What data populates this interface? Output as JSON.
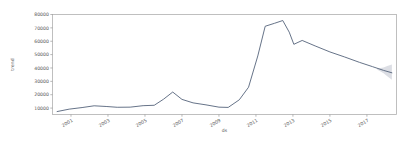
{
  "figure": {
    "background_color": "#ffffff",
    "line_color": "#4a5a72",
    "band_color": "#8a93a5",
    "spine_color": "#b0b0b0"
  },
  "chart_data": {
    "type": "line",
    "title": "",
    "xlabel": "ds",
    "ylabel": "trend",
    "grid": false,
    "legend": null,
    "xlim": [
      2000.0,
      2018.6
    ],
    "ylim": [
      5200,
      80000
    ],
    "xticks": [
      2001,
      2003,
      2005,
      2007,
      2009,
      2011,
      2013,
      2015,
      2017
    ],
    "xticklabels": [
      "2001",
      "2003",
      "2005",
      "2007",
      "2009",
      "2011",
      "2013",
      "2015",
      "2017"
    ],
    "xtick_rotation": 30,
    "yticks": [
      10000,
      20000,
      30000,
      40000,
      50000,
      60000,
      70000,
      80000
    ],
    "yticklabels": [
      "10000",
      "20000",
      "30000",
      "40000",
      "50000",
      "60000",
      "70000",
      "80000"
    ],
    "series": [
      {
        "name": "trend",
        "x": [
          2000.25,
          2000.9,
          2001.6,
          2002.25,
          2002.9,
          2003.5,
          2004.2,
          2004.9,
          2005.5,
          2006.0,
          2006.5,
          2007.0,
          2007.6,
          2008.3,
          2009.0,
          2009.5,
          2010.1,
          2010.6,
          2011.1,
          2011.5,
          2012.0,
          2012.45,
          2012.8,
          2013.05,
          2013.5,
          2014.2,
          2015.0,
          2015.8,
          2016.6,
          2017.3,
          2017.9,
          2018.35
        ],
        "values": [
          7400,
          9200,
          10400,
          11700,
          11200,
          10600,
          10700,
          11800,
          12100,
          16600,
          22000,
          16500,
          13900,
          12400,
          10700,
          10500,
          16200,
          25600,
          49000,
          71200,
          73400,
          75500,
          66800,
          57700,
          60600,
          56500,
          52000,
          48200,
          44200,
          41000,
          38200,
          36400
        ]
      }
    ],
    "uncertainty_band": {
      "name": "trend uncertainty",
      "x": [
        2017.55,
        2017.9,
        2018.1,
        2018.35
      ],
      "lower": [
        38800,
        36000,
        33800,
        31200
      ],
      "upper": [
        39600,
        40400,
        41400,
        42600
      ]
    },
    "annotations": []
  }
}
